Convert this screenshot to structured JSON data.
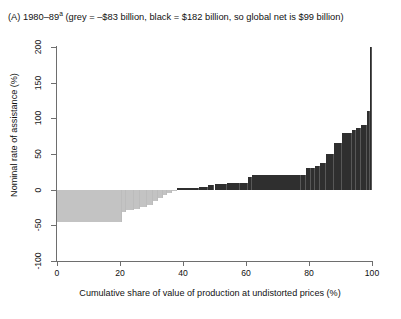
{
  "figure": {
    "panel_label": "(A)",
    "title_text": "(A) 1980–89ᵃ (grey = –$83 billion, black = $182 billion, so global net is $99 billion)",
    "title_main": "(A) 1980–89",
    "title_footnote_marker": "a",
    "title_rest": " (grey = –$83 billion, black = $182 billion, so global net is $99 billion)",
    "grey_total_label": "grey = –$83 billion",
    "black_total_label": "black = $182 billion",
    "net_label": "so global net is $99 billion",
    "period": "1980–89"
  },
  "colors": {
    "negative_bars": "#c3c3c3",
    "positive_bars": "#2f2f2f",
    "axis": "#6e6e6e",
    "text": "#111111",
    "background": "#ffffff"
  },
  "axes": {
    "y_label": "Nominal rate of assistance (%)",
    "x_label": "Cumulative share of value of production at undistorted prices (%)",
    "y_ticks": [
      "-100",
      "-50",
      "0",
      "50",
      "100",
      "150",
      "200"
    ],
    "y_tick_values": [
      -100,
      -50,
      0,
      50,
      100,
      150,
      200
    ],
    "x_ticks": [
      "0",
      "20",
      "40",
      "60",
      "80",
      "100"
    ],
    "x_tick_values": [
      0,
      20,
      40,
      60,
      80,
      100
    ],
    "ylim": [
      -100,
      200
    ],
    "xlim": [
      0,
      100
    ],
    "grid": false
  },
  "chart_data": {
    "type": "bar",
    "xlabel": "Cumulative share of value of production at undistorted prices (%)",
    "ylabel": "Nominal rate of assistance (%)",
    "xlim": [
      0,
      100
    ],
    "ylim": [
      -100,
      200
    ],
    "grid": false,
    "legend": null,
    "negative_color": "#c3c3c3",
    "positive_color": "#2f2f2f",
    "bars": [
      {
        "x_start": 0.0,
        "x_end": 20.5,
        "value": -45,
        "sign": "negative"
      },
      {
        "x_start": 20.5,
        "x_end": 22.0,
        "value": -31,
        "sign": "negative"
      },
      {
        "x_start": 22.0,
        "x_end": 24.5,
        "value": -29,
        "sign": "negative"
      },
      {
        "x_start": 24.5,
        "x_end": 26.5,
        "value": -27,
        "sign": "negative"
      },
      {
        "x_start": 26.5,
        "x_end": 28.5,
        "value": -25,
        "sign": "negative"
      },
      {
        "x_start": 28.5,
        "x_end": 30.5,
        "value": -21,
        "sign": "negative"
      },
      {
        "x_start": 30.5,
        "x_end": 32.0,
        "value": -16,
        "sign": "negative"
      },
      {
        "x_start": 32.0,
        "x_end": 33.5,
        "value": -12,
        "sign": "negative"
      },
      {
        "x_start": 33.5,
        "x_end": 35.0,
        "value": -8,
        "sign": "negative"
      },
      {
        "x_start": 35.0,
        "x_end": 36.5,
        "value": -5,
        "sign": "negative"
      },
      {
        "x_start": 36.5,
        "x_end": 38.0,
        "value": -2,
        "sign": "negative"
      },
      {
        "x_start": 38.0,
        "x_end": 45.0,
        "value": 3,
        "sign": "positive"
      },
      {
        "x_start": 45.0,
        "x_end": 48.0,
        "value": 4,
        "sign": "positive"
      },
      {
        "x_start": 48.0,
        "x_end": 50.0,
        "value": 7,
        "sign": "positive"
      },
      {
        "x_start": 50.0,
        "x_end": 54.0,
        "value": 8,
        "sign": "positive"
      },
      {
        "x_start": 54.0,
        "x_end": 58.0,
        "value": 9,
        "sign": "positive"
      },
      {
        "x_start": 58.0,
        "x_end": 60.5,
        "value": 10,
        "sign": "positive"
      },
      {
        "x_start": 60.5,
        "x_end": 62.0,
        "value": 18,
        "sign": "positive"
      },
      {
        "x_start": 62.0,
        "x_end": 77.5,
        "value": 20,
        "sign": "positive"
      },
      {
        "x_start": 77.5,
        "x_end": 79.0,
        "value": 21,
        "sign": "positive"
      },
      {
        "x_start": 79.0,
        "x_end": 80.5,
        "value": 30,
        "sign": "positive"
      },
      {
        "x_start": 80.5,
        "x_end": 82.0,
        "value": 31,
        "sign": "positive"
      },
      {
        "x_start": 82.0,
        "x_end": 83.5,
        "value": 33,
        "sign": "positive"
      },
      {
        "x_start": 83.5,
        "x_end": 85.5,
        "value": 38,
        "sign": "positive"
      },
      {
        "x_start": 85.5,
        "x_end": 88.0,
        "value": 50,
        "sign": "positive"
      },
      {
        "x_start": 88.0,
        "x_end": 90.5,
        "value": 65,
        "sign": "positive"
      },
      {
        "x_start": 90.5,
        "x_end": 93.5,
        "value": 80,
        "sign": "positive"
      },
      {
        "x_start": 93.5,
        "x_end": 95.0,
        "value": 84,
        "sign": "positive"
      },
      {
        "x_start": 95.0,
        "x_end": 96.5,
        "value": 86,
        "sign": "positive"
      },
      {
        "x_start": 96.5,
        "x_end": 98.5,
        "value": 90,
        "sign": "positive"
      },
      {
        "x_start": 98.5,
        "x_end": 99.4,
        "value": 110,
        "sign": "positive"
      },
      {
        "x_start": 99.4,
        "x_end": 100.0,
        "value": 200,
        "sign": "positive"
      }
    ]
  }
}
